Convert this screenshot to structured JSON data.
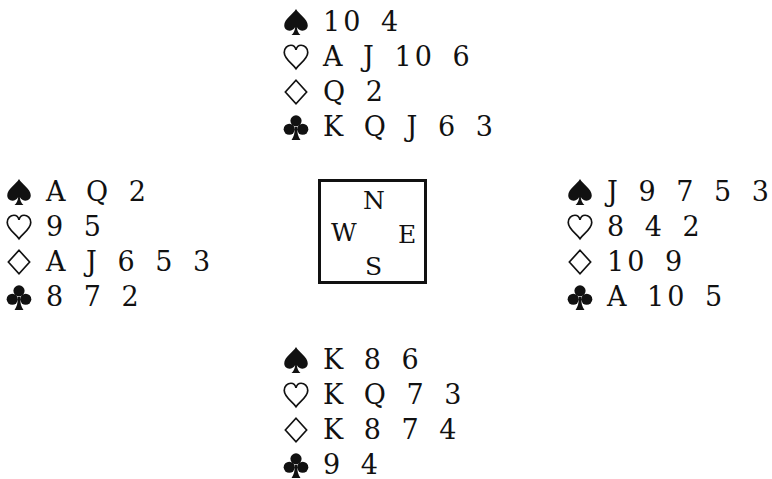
{
  "hands": {
    "north": {
      "spades": "10 4",
      "hearts": "A J 10 6",
      "diamonds": "Q 2",
      "clubs": "K Q J 6 3"
    },
    "west": {
      "spades": "A Q 2",
      "hearts": "9 5",
      "diamonds": "A J 6 5 3",
      "clubs": "8 7 2"
    },
    "east": {
      "spades": "J 9 7 5 3",
      "hearts": "8 4 2",
      "diamonds": "10 9",
      "clubs": "A 10 5"
    },
    "south": {
      "spades": "K 8 6",
      "hearts": "K Q 7 3",
      "diamonds": "K 8 7 4",
      "clubs": "9 4"
    }
  },
  "compass": {
    "north": "N",
    "west": "W",
    "east": "E",
    "south": "S"
  },
  "suit_icons": {
    "spades": "spade-icon",
    "hearts": "heart-icon",
    "diamonds": "diamond-icon",
    "clubs": "club-icon"
  }
}
